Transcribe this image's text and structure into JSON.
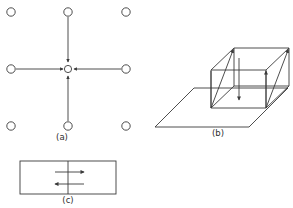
{
  "figure": {
    "background_color": "#ffffff",
    "line_color": "#3a3a3a",
    "text_color": "#2e2e2e",
    "width": 293,
    "height": 208,
    "panels": [
      {
        "id": "a",
        "caption": "(a)",
        "caption_x": 62,
        "caption_y": 140,
        "type": "vacancy-lattice",
        "description": "Square lattice of atoms with four arrows converging on a central vacancy",
        "atom_radius": 4.2,
        "vacancy_radius": 3.6,
        "vacancy_center": {
          "x": 68,
          "y": 69
        },
        "atoms": [
          {
            "x": 11,
            "y": 12
          },
          {
            "x": 68,
            "y": 12
          },
          {
            "x": 126,
            "y": 12
          },
          {
            "x": 11,
            "y": 69
          },
          {
            "x": 126,
            "y": 69
          },
          {
            "x": 11,
            "y": 126
          },
          {
            "x": 68,
            "y": 126
          },
          {
            "x": 126,
            "y": 126
          }
        ],
        "flux_arrows": [
          {
            "from_x": 68,
            "from_y": 17,
            "to_x": 68,
            "to_y": 62,
            "direction": "down"
          },
          {
            "from_x": 68,
            "from_y": 121,
            "to_x": 68,
            "to_y": 76,
            "direction": "up"
          },
          {
            "from_x": 16,
            "from_y": 69,
            "to_x": 62,
            "to_y": 69,
            "direction": "right"
          },
          {
            "from_x": 121,
            "from_y": 69,
            "to_x": 75,
            "to_y": 69,
            "direction": "left"
          }
        ]
      },
      {
        "id": "b",
        "caption": "(b)",
        "caption_x": 218,
        "caption_y": 136,
        "type": "box-on-plane",
        "description": "Wireframe box resting on a plane with three upward arrows and one downward arrow",
        "plane": [
          {
            "x": 155,
            "y": 127
          },
          {
            "x": 194,
            "y": 88
          },
          {
            "x": 288,
            "y": 88
          },
          {
            "x": 249,
            "y": 127
          }
        ],
        "box": {
          "front_bottom_left": {
            "x": 211,
            "y": 108
          },
          "front_bottom_right": {
            "x": 266,
            "y": 108
          },
          "front_top_left": {
            "x": 211,
            "y": 70
          },
          "front_top_right": {
            "x": 266,
            "y": 70
          },
          "back_bottom_left": {
            "x": 234,
            "y": 86
          },
          "back_bottom_right": {
            "x": 289,
            "y": 86
          },
          "back_top_left": {
            "x": 234,
            "y": 48
          },
          "back_top_right": {
            "x": 289,
            "y": 48
          }
        },
        "arrows": [
          {
            "from_x": 211,
            "from_y": 108,
            "to_x": 211,
            "to_y": 70,
            "direction": "up"
          },
          {
            "from_x": 266,
            "from_y": 108,
            "to_x": 266,
            "to_y": 70,
            "direction": "up"
          },
          {
            "from_x": 211,
            "from_y": 108,
            "to_x": 234,
            "to_y": 48,
            "direction": "up-back"
          },
          {
            "from_x": 266,
            "from_y": 108,
            "to_x": 289,
            "to_y": 48,
            "direction": "up-back"
          },
          {
            "from_x": 239,
            "from_y": 58,
            "to_x": 239,
            "to_y": 100,
            "direction": "down"
          }
        ]
      },
      {
        "id": "c",
        "caption": "(c)",
        "caption_x": 68,
        "caption_y": 203,
        "type": "rectangle-shear",
        "description": "Rectangular grain boundary slab with opposing horizontal arrows",
        "rect": {
          "x": 20,
          "y": 161,
          "width": 96,
          "height": 33
        },
        "center_line": {
          "x": 68,
          "y_top": 161,
          "y_bottom": 194
        },
        "arrows": [
          {
            "from_x": 55,
            "from_y": 172,
            "to_x": 84,
            "to_y": 172,
            "direction": "right"
          },
          {
            "from_x": 84,
            "from_y": 184,
            "to_x": 55,
            "to_y": 184,
            "direction": "left"
          }
        ]
      }
    ]
  }
}
